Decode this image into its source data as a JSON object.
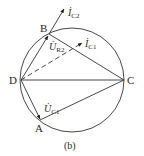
{
  "figure": {
    "caption": "(b)",
    "stroke_color": "#333333",
    "points": {
      "B": {
        "label": "B"
      },
      "C": {
        "label": "C"
      },
      "D": {
        "label": "D"
      },
      "A": {
        "label": "A"
      }
    },
    "vectors": {
      "ic2": {
        "main": "İ",
        "sub": "C2"
      },
      "ic1": {
        "main": "İ",
        "sub": "C1"
      },
      "ur2": {
        "main": "U̇",
        "sub": "R2"
      },
      "uc1": {
        "main": "U̇",
        "sub": "C1"
      }
    }
  }
}
